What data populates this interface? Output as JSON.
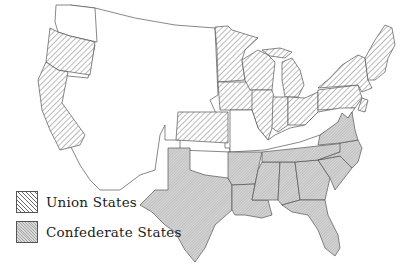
{
  "map": {
    "subject": "United States during the Civil War",
    "regions": [
      {
        "name": "Union States",
        "style": "diagonal-hatch",
        "color": "#666666"
      },
      {
        "name": "Confederate States",
        "style": "gray-fill",
        "color": "#c8c8c8"
      },
      {
        "name": "Territories",
        "style": "unfilled",
        "color": "#ffffff"
      }
    ]
  },
  "legend": {
    "items": [
      {
        "label": "Union States",
        "icon": "union-hatch-swatch"
      },
      {
        "label": "Confederate States",
        "icon": "confederate-gray-swatch"
      }
    ]
  }
}
